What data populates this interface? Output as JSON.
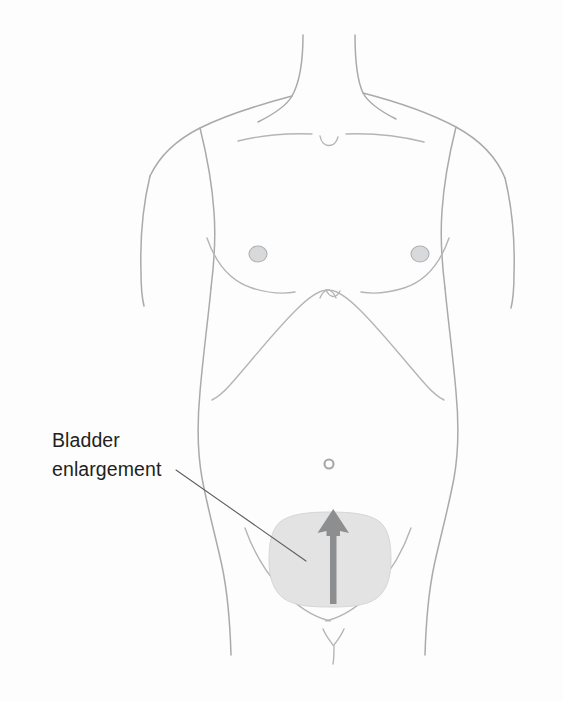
{
  "figure": {
    "name": "bladder-enlargement-anatomical-illustration",
    "background_color": "#fdfdfd"
  },
  "callout": {
    "line1": "Bladder",
    "line2": "enlargement",
    "text_color": "#231f20",
    "leader_line_color": "#5d5e60",
    "leader_start": {
      "x": 176,
      "y": 470
    },
    "leader_end": {
      "x": 306,
      "y": 561
    }
  },
  "bladder": {
    "label": "bladder-region",
    "fill_color": "#e3e3e3",
    "border_color": "#d6d6d6",
    "bounds": {
      "x": 270,
      "y": 512,
      "width": 120,
      "height": 94
    }
  },
  "arrow": {
    "label": "enlargement-direction-arrow",
    "direction": "up",
    "color": "#8d8e90",
    "tip": {
      "x": 334,
      "y": 509
    },
    "tail": {
      "x": 334,
      "y": 604
    }
  },
  "anatomy": {
    "outline_color": "#a9aaac",
    "features": [
      "neck",
      "clavicle-notch",
      "left-shoulder",
      "right-shoulder",
      "left-arm",
      "right-arm",
      "left-pectoral-crease",
      "right-pectoral-crease",
      "left-nipple",
      "right-nipple",
      "costal-margin",
      "xiphoid-notch",
      "left-flank",
      "right-flank",
      "navel",
      "left-inguinal-ligament",
      "right-inguinal-ligament",
      "genital-marking"
    ],
    "nipples": {
      "fill_color": "#d8d9da",
      "left": {
        "x": 258,
        "y": 254,
        "rx": 9,
        "ry": 8
      },
      "right": {
        "x": 420,
        "y": 254,
        "rx": 9,
        "ry": 8
      }
    },
    "navel": {
      "x": 329,
      "y": 464,
      "r": 4.5
    }
  }
}
